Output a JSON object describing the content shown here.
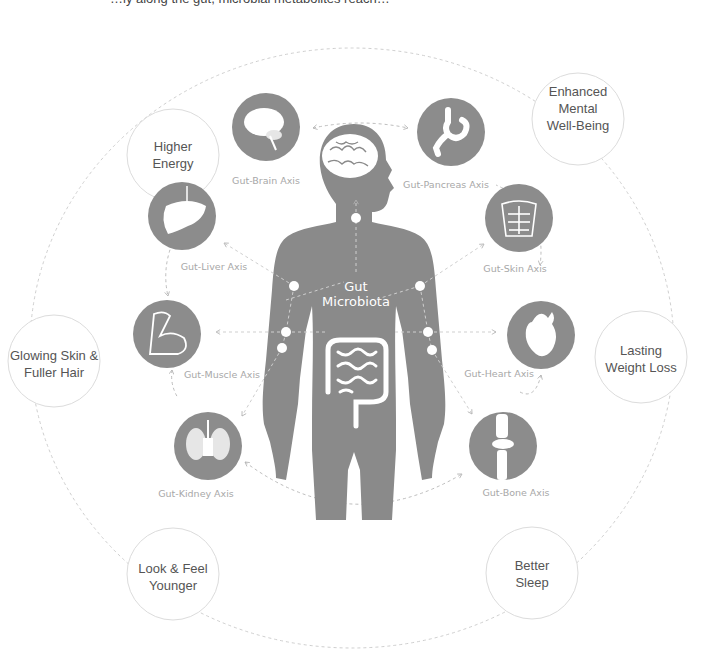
{
  "header": {
    "cut_text": "…ly along the gut, microbial metabolites reach…"
  },
  "center": {
    "line1": "Gut",
    "line2": "Microbiota"
  },
  "benefits": [
    {
      "id": "higher-energy",
      "lines": [
        "Higher",
        "Energy"
      ]
    },
    {
      "id": "mental-wellbeing",
      "lines": [
        "Enhanced",
        "Mental",
        "Well-Being"
      ]
    },
    {
      "id": "glowing-skin",
      "lines": [
        "Glowing Skin &",
        "Fuller Hair"
      ]
    },
    {
      "id": "weight-loss",
      "lines": [
        "Lasting",
        "Weight Loss"
      ]
    },
    {
      "id": "look-younger",
      "lines": [
        "Look & Feel",
        "Younger"
      ]
    },
    {
      "id": "better-sleep",
      "lines": [
        "Better",
        "Sleep"
      ]
    }
  ],
  "axes": [
    {
      "id": "brain",
      "label": "Gut-Brain Axis"
    },
    {
      "id": "pancreas",
      "label": "Gut-Pancreas Axis"
    },
    {
      "id": "liver",
      "label": "Gut-Liver Axis"
    },
    {
      "id": "skin",
      "label": "Gut-Skin Axis"
    },
    {
      "id": "muscle",
      "label": "Gut-Muscle Axis"
    },
    {
      "id": "heart",
      "label": "Gut-Heart Axis"
    },
    {
      "id": "kidney",
      "label": "Gut-Kidney Axis"
    },
    {
      "id": "bone",
      "label": "Gut-Bone Axis"
    }
  ],
  "colors": {
    "icon_gray": "#8c8c8c",
    "body_gray": "#8a8a8a",
    "dash": "#bdbdbd",
    "circle_stroke": "#dcdcdc"
  }
}
